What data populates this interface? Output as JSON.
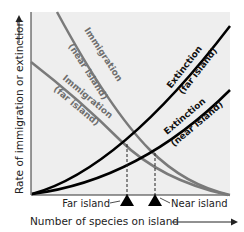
{
  "colors": {
    "plot_bg": "#eeeeee",
    "immigration": "#7a7a7a",
    "extinction": "#000000",
    "axis": "#333333",
    "text_dark": "#222222",
    "text_gray": "#6e6e6e"
  },
  "axes": {
    "y_label": "Rate of immigration or extinction",
    "x_label": "Number of species on island"
  },
  "curves": {
    "immigration_near_line1": "Immigration",
    "immigration_near_line2": "(near island)",
    "immigration_far_line1": "Immigration",
    "immigration_far_line2": "(far island)",
    "extinction_far_line1": "Extinction",
    "extinction_far_line2": "(far island)",
    "extinction_near_line1": "Extinction",
    "extinction_near_line2": "(near island)"
  },
  "markers": {
    "far": "Far island",
    "near": "Near island"
  }
}
